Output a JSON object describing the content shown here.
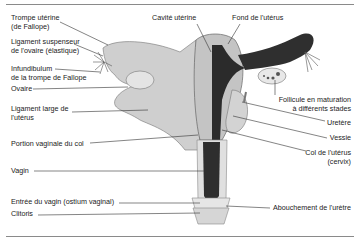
{
  "figure": {
    "labels_left": [
      {
        "id": "trompe",
        "line1": "Trompe utérine",
        "line2": "(de Fallope)"
      },
      {
        "id": "ligament-suspenseur",
        "line1": "Ligament suspenseur",
        "line2": "de l'ovaire (élastique)"
      },
      {
        "id": "infundibulum",
        "line1": "Infundibulum",
        "line2": "de la trompe de Fallope"
      },
      {
        "id": "ovaire",
        "line1": "Ovaire"
      },
      {
        "id": "ligament-large",
        "line1": "Ligament large de",
        "line2": "l'utérus"
      },
      {
        "id": "portion-vaginale",
        "line1": "Portion vaginale du col"
      },
      {
        "id": "vagin",
        "line1": "Vagin"
      },
      {
        "id": "entree-vagin",
        "line1": "Entrée du vagin (ostium vaginal)"
      },
      {
        "id": "clitoris",
        "line1": "Clitoris"
      }
    ],
    "labels_top": [
      {
        "id": "cavite",
        "line1": "Cavité utérine"
      },
      {
        "id": "fond",
        "line1": "Fond de l'utérus"
      }
    ],
    "labels_right": [
      {
        "id": "follicule",
        "line1": "Follicule en maturation",
        "line2": "à différents stades"
      },
      {
        "id": "uretere",
        "line1": "Uretère"
      },
      {
        "id": "vessie",
        "line1": "Vessie"
      },
      {
        "id": "col",
        "line1": "Col de l'utérus",
        "line2": "(cervix)"
      },
      {
        "id": "abouchement",
        "line1": "Abouchement de l'urètre"
      }
    ]
  },
  "colors": {
    "tissue": "#c9c9c9",
    "tissue_light": "#dcdcdc",
    "tissue_dark": "#9a9a9a",
    "cavity": "#2b2b2b",
    "leader": "#333333",
    "rule": "#8a8a8a"
  }
}
